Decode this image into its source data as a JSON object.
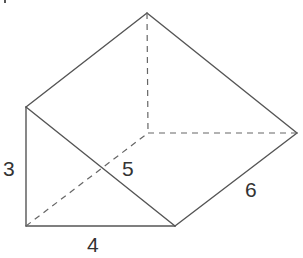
{
  "diagram": {
    "colors": {
      "edge": "#555555",
      "hidden_edge": "#666666",
      "label": "#333333",
      "background": "#ffffff"
    },
    "vertices": {
      "top_back": [
        147,
        13
      ],
      "left_top": [
        26,
        107
      ],
      "bottom_left": [
        26,
        226
      ],
      "bottom_right": [
        175,
        226
      ],
      "right": [
        297,
        133
      ],
      "hidden_back": [
        148,
        133
      ]
    },
    "labels": {
      "height": "3",
      "hypotenuse": "5",
      "length": "6",
      "base": "4"
    }
  }
}
